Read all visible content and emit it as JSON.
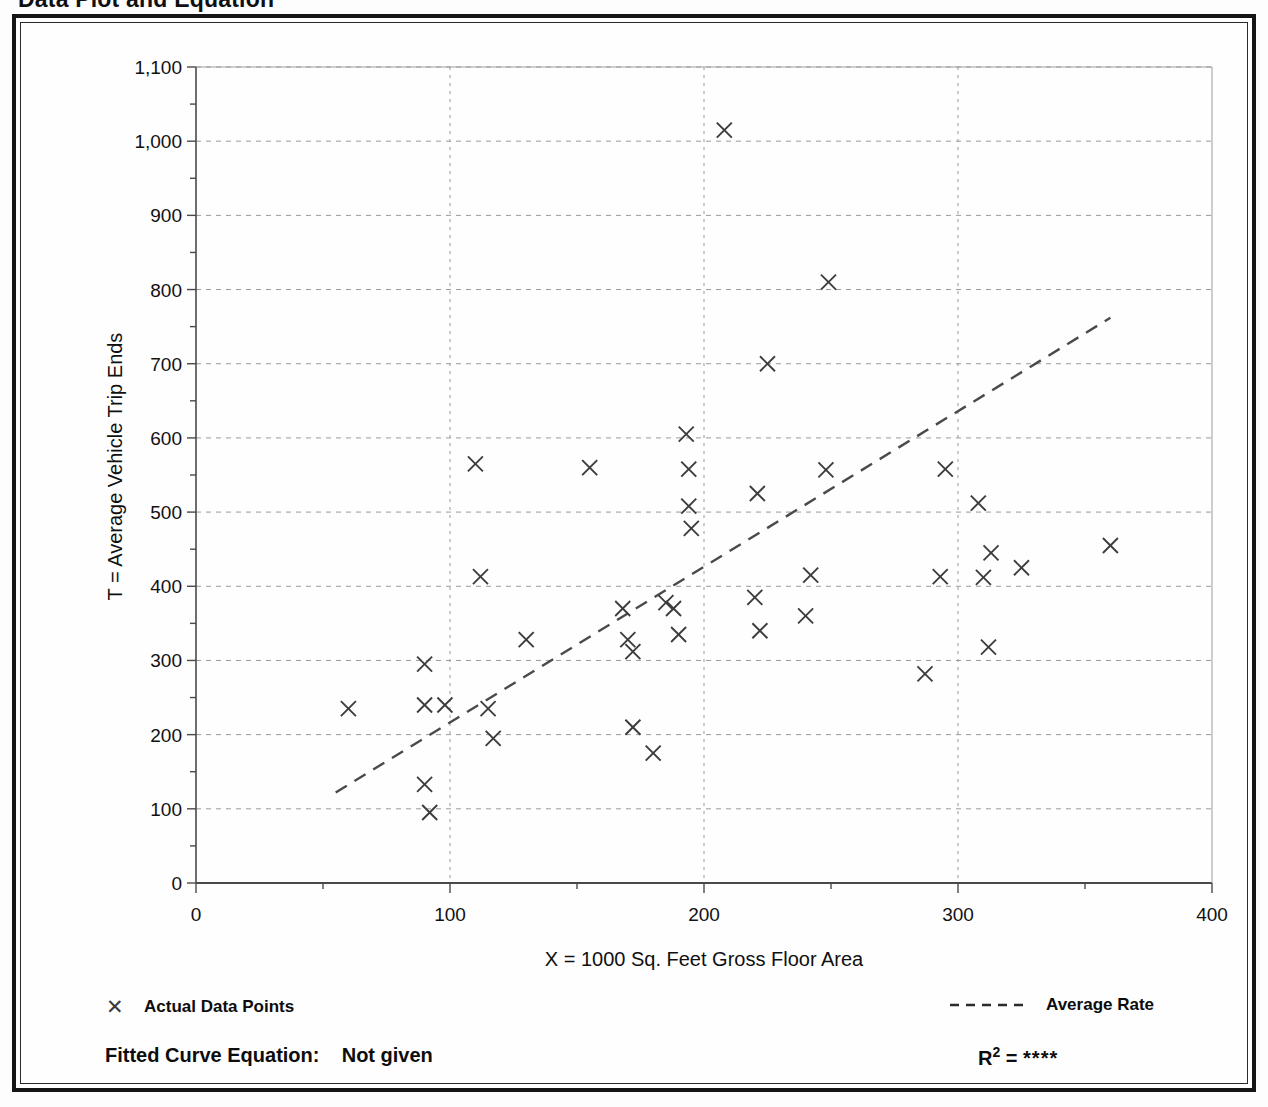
{
  "page": {
    "title": "Data Plot and Equation"
  },
  "axes": {
    "x_title": "X = 1000 Sq. Feet Gross Floor Area",
    "y_title": "T = Average Vehicle Trip Ends",
    "x_ticks": [
      "0",
      "100",
      "200",
      "300",
      "400"
    ],
    "y_ticks": [
      "0",
      "100",
      "200",
      "300",
      "400",
      "500",
      "600",
      "700",
      "800",
      "900",
      "1,000",
      "1,100"
    ]
  },
  "legend": {
    "points_marker": "✕",
    "points_label": "Actual Data Points",
    "rate_label": "Average Rate"
  },
  "footer": {
    "equation_label": "Fitted Curve Equation:",
    "equation_value": "Not given",
    "r_label": "R",
    "r_exponent": "2",
    "r_equals": "=",
    "r_value": "****"
  },
  "colors": {
    "frame": "#151515",
    "grid": "#9a9a9a",
    "axis": "#555555",
    "marker": "#3c3c3c",
    "trend": "#4a4a4a",
    "background": "#fefefe"
  },
  "chart_data": {
    "type": "scatter",
    "title": "Data Plot and Equation",
    "xlabel": "X = 1000 Sq. Feet Gross Floor Area",
    "ylabel": "T = Average Vehicle Trip Ends",
    "xlim": [
      0,
      400
    ],
    "ylim": [
      0,
      1100
    ],
    "x_major_step": 100,
    "x_minor_step": 50,
    "y_major_step": 100,
    "y_minor_step": 50,
    "grid": true,
    "grid_style": "dotted",
    "legend_position": "below-axes",
    "marker": "x",
    "series": [
      {
        "name": "Actual Data Points",
        "type": "scatter",
        "points": [
          [
            60,
            235
          ],
          [
            90,
            295
          ],
          [
            90,
            240
          ],
          [
            90,
            133
          ],
          [
            92,
            95
          ],
          [
            98,
            240
          ],
          [
            110,
            565
          ],
          [
            112,
            413
          ],
          [
            115,
            235
          ],
          [
            117,
            195
          ],
          [
            130,
            328
          ],
          [
            155,
            560
          ],
          [
            168,
            370
          ],
          [
            170,
            328
          ],
          [
            172,
            312
          ],
          [
            172,
            210
          ],
          [
            180,
            175
          ],
          [
            185,
            378
          ],
          [
            188,
            370
          ],
          [
            190,
            335
          ],
          [
            193,
            605
          ],
          [
            194,
            558
          ],
          [
            194,
            508
          ],
          [
            195,
            478
          ],
          [
            208,
            1015
          ],
          [
            220,
            385
          ],
          [
            221,
            525
          ],
          [
            222,
            340
          ],
          [
            225,
            700
          ],
          [
            240,
            360
          ],
          [
            242,
            415
          ],
          [
            248,
            557
          ],
          [
            249,
            810
          ],
          [
            287,
            282
          ],
          [
            293,
            413
          ],
          [
            295,
            558
          ],
          [
            308,
            512
          ],
          [
            310,
            412
          ],
          [
            312,
            318
          ],
          [
            313,
            445
          ],
          [
            325,
            425
          ],
          [
            360,
            455
          ]
        ],
        "count": 42
      },
      {
        "name": "Average Rate",
        "type": "line",
        "style": "dashed",
        "endpoints": [
          [
            55,
            122
          ],
          [
            360,
            762
          ]
        ]
      }
    ]
  }
}
